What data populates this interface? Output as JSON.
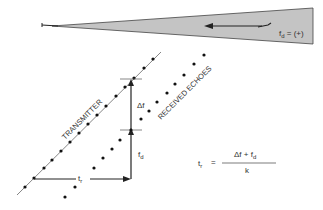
{
  "beam": {
    "label": "f",
    "label_sub": "d",
    "label_rest": " = (+)",
    "fill_color": "#c4c4c4"
  },
  "diagram": {
    "transmitter_label": "TRANSMITTER",
    "echoes_label": "RECEIVED ECHOES",
    "delta_f_label": "Δf",
    "fd_label": "f",
    "fd_sub": "d",
    "tr_label": "t",
    "tr_sub": "r"
  },
  "formula": {
    "lhs": "t",
    "lhs_sub": "r",
    "equals": "=",
    "numerator_a": "Δf + f",
    "numerator_sub": "d",
    "denominator": "k"
  }
}
